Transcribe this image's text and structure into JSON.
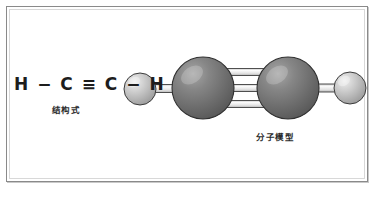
{
  "figure": {
    "background_color": "#ffffff",
    "frame_color": "#8a8a8a"
  },
  "structural_formula": {
    "formula_text": "H − C ≡ C − H",
    "caption": "结构式",
    "atoms": [
      "H",
      "C",
      "C",
      "H"
    ],
    "bond_symbols": [
      "−",
      "≡",
      "−"
    ]
  },
  "molecular_model": {
    "caption": "分子模型",
    "hydrogen_color": "#b9b9b9",
    "hydrogen_highlight": "#e2e2e2",
    "carbon_color": "#6e6e6e",
    "carbon_highlight": "#9a9a9a",
    "bond_color": "#ececec",
    "outline_color": "#3a3a3a",
    "atoms": [
      {
        "label": "H",
        "element": "hydrogen",
        "cx": 140,
        "cy": 89,
        "r": 16
      },
      {
        "label": "C",
        "element": "carbon",
        "cx": 203,
        "cy": 88,
        "r": 31
      },
      {
        "label": "C",
        "element": "carbon",
        "cx": 288,
        "cy": 88,
        "r": 31
      },
      {
        "label": "H",
        "element": "hydrogen",
        "cx": 350,
        "cy": 88,
        "r": 16
      }
    ],
    "bonds": [
      {
        "from": "H",
        "to": "C",
        "order": 1
      },
      {
        "from": "C",
        "to": "C",
        "order": 3
      },
      {
        "from": "C",
        "to": "H",
        "order": 1
      }
    ]
  }
}
